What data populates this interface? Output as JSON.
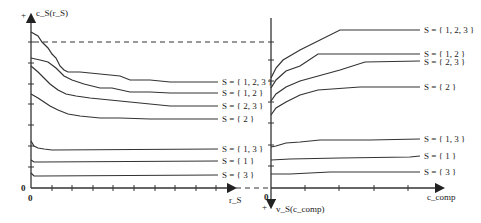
{
  "left_panel": {
    "y_axis_label": "c_S(r_S)",
    "y_axis_sign": "+",
    "x_axis_label": "r_S",
    "origin_x": "0",
    "origin_y": "0",
    "series": [
      {
        "label": "S = { 1, 2, 3 }"
      },
      {
        "label": "S = { 1, 2 }"
      },
      {
        "label": "S = { 2, 3 }"
      },
      {
        "label": "S = { 2 }"
      },
      {
        "label": "S = { 1, 3 }"
      },
      {
        "label": "S = { 1 }"
      },
      {
        "label": "S = { 3 }"
      }
    ]
  },
  "right_panel": {
    "y_axis_label": "v_S(c_comp)",
    "y_axis_sign": "+",
    "x_axis_label": "c_comp",
    "origin_x": "0",
    "series": [
      {
        "label": "S = { 1, 2, 3 }"
      },
      {
        "label": "S = { 1, 2 }"
      },
      {
        "label": "S = { 2, 3 }"
      },
      {
        "label": "S = { 2 }"
      },
      {
        "label": "S = { 1, 3 }"
      },
      {
        "label": "S = { 1 }"
      },
      {
        "label": "S = { 3 }"
      }
    ]
  }
}
